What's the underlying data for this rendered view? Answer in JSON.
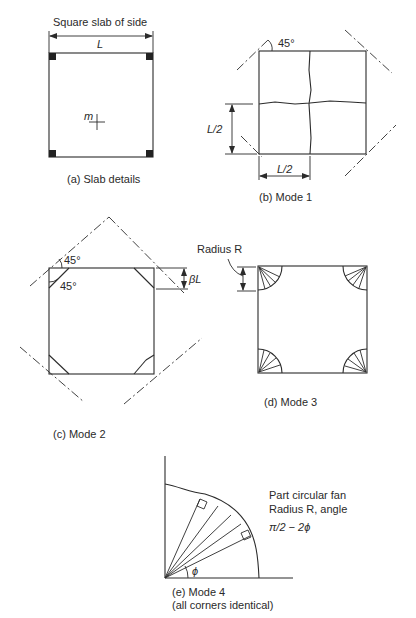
{
  "figure": {
    "panels": [
      {
        "id": "a",
        "caption": "(a) Slab details",
        "title": "Square slab of side",
        "dimension_label": "L",
        "moment_label": "m"
      },
      {
        "id": "b",
        "caption": "(b) Mode 1",
        "angle_label": "45°",
        "vertical_dim_label": "L/2",
        "horizontal_dim_label": "L/2"
      },
      {
        "id": "c",
        "caption": "(c) Mode 2",
        "angle_top_label": "45°",
        "angle_side_label": "45°",
        "corner_dim_label": "βL"
      },
      {
        "id": "d",
        "caption": "(d) Mode 3",
        "radius_label": "Radius R"
      },
      {
        "id": "e",
        "caption_line1": "(e) Mode 4",
        "caption_line2": "(all corners identical)",
        "note_line1": "Part circular fan",
        "note_line2": "Radius R, angle",
        "note_formula": "π/2 − 2ϕ",
        "angle_label": "ϕ"
      }
    ]
  }
}
